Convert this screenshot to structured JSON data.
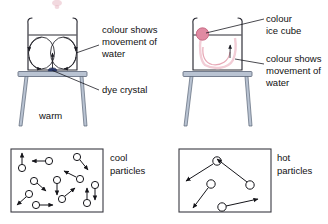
{
  "figure": {
    "background_color": "#ffffff",
    "ink_color": "#1b1b22",
    "stand_color": "#b9c3d2",
    "stand_outline_color": "#5a6577",
    "dye_color": "#2b3a6b",
    "ice_color": "#e08aa2",
    "pink_trail_color": "#e7a8b6"
  },
  "left_experiment": {
    "name": "warm-beaker-experiment",
    "heat_label": "warm",
    "annotations": [
      {
        "id": "colour-shows-movement",
        "lines": [
          "colour shows",
          "movement of",
          "water"
        ]
      },
      {
        "id": "dye-crystal",
        "lines": [
          "dye crystal"
        ]
      }
    ],
    "beaker": {
      "contents": "water",
      "convection_loops": 2,
      "loop_direction": "rising in centre above crystal, falling at the sides",
      "crystal_label": "dye crystal",
      "crystal_position": "centre of beaker base"
    }
  },
  "right_experiment": {
    "name": "cold-beaker-experiment",
    "heat_label": "",
    "annotations": [
      {
        "id": "colour-ice-cube",
        "lines": [
          "colour",
          "ice cube"
        ]
      },
      {
        "id": "colour-shows-movement",
        "lines": [
          "colour shows",
          "movement of",
          "water"
        ]
      }
    ],
    "beaker": {
      "contents": "water",
      "convection_loops": 1,
      "loop_direction": "coloured melt sinks from the ice cube, spreads along base and rises",
      "ice_label": "colour ice cube",
      "ice_position": "top left of beaker, at water surface"
    }
  },
  "particle_boxes": [
    {
      "name": "cool-particles-box",
      "label_lines": [
        "cool",
        "particles"
      ],
      "temperature": "cool",
      "particle_count": 11,
      "arrow_length_description": "short arrows — slow movement",
      "particles": [
        {
          "cx": 19,
          "cy": 166,
          "ax": 19,
          "ay": 152
        },
        {
          "cx": 46,
          "cy": 161,
          "ax": 28,
          "ay": 159
        },
        {
          "cx": 76,
          "cy": 157,
          "ax": 86,
          "ay": 168
        },
        {
          "cx": 79,
          "cy": 178,
          "ax": 65,
          "ay": 172
        },
        {
          "cx": 33,
          "cy": 180,
          "ax": 45,
          "ay": 189
        },
        {
          "cx": 56,
          "cy": 180,
          "ax": 56,
          "ay": 194
        },
        {
          "cx": 28,
          "cy": 194,
          "ax": 15,
          "ay": 204
        },
        {
          "cx": 35,
          "cy": 204,
          "ax": 52,
          "ay": 206
        },
        {
          "cx": 61,
          "cy": 199,
          "ax": 75,
          "ay": 188
        },
        {
          "cx": 85,
          "cy": 202,
          "ax": 85,
          "ay": 188
        },
        {
          "cx": 95,
          "cy": 180,
          "ax": 95,
          "ay": 180
        }
      ]
    },
    {
      "name": "hot-particles-box",
      "label_lines": [
        "hot",
        "particles"
      ],
      "temperature": "hot",
      "particle_count": 4,
      "arrow_length_description": "long arrows — fast movement",
      "particles": [
        {
          "cx": 216,
          "cy": 162,
          "ax": 186,
          "ay": 180
        },
        {
          "cx": 249,
          "cy": 185,
          "ax": 216,
          "ay": 160
        },
        {
          "cx": 210,
          "cy": 184,
          "ax": 191,
          "ay": 210
        },
        {
          "cx": 221,
          "cy": 207,
          "ax": 257,
          "ay": 199
        }
      ]
    }
  ],
  "texts": {
    "colour_shows": "colour shows",
    "movement_of": "movement of",
    "water": "water",
    "dye_crystal": "dye crystal",
    "colour": "colour",
    "ice_cube": "ice cube",
    "warm": "warm",
    "cool": "cool",
    "particles": "particles",
    "hot": "hot"
  }
}
